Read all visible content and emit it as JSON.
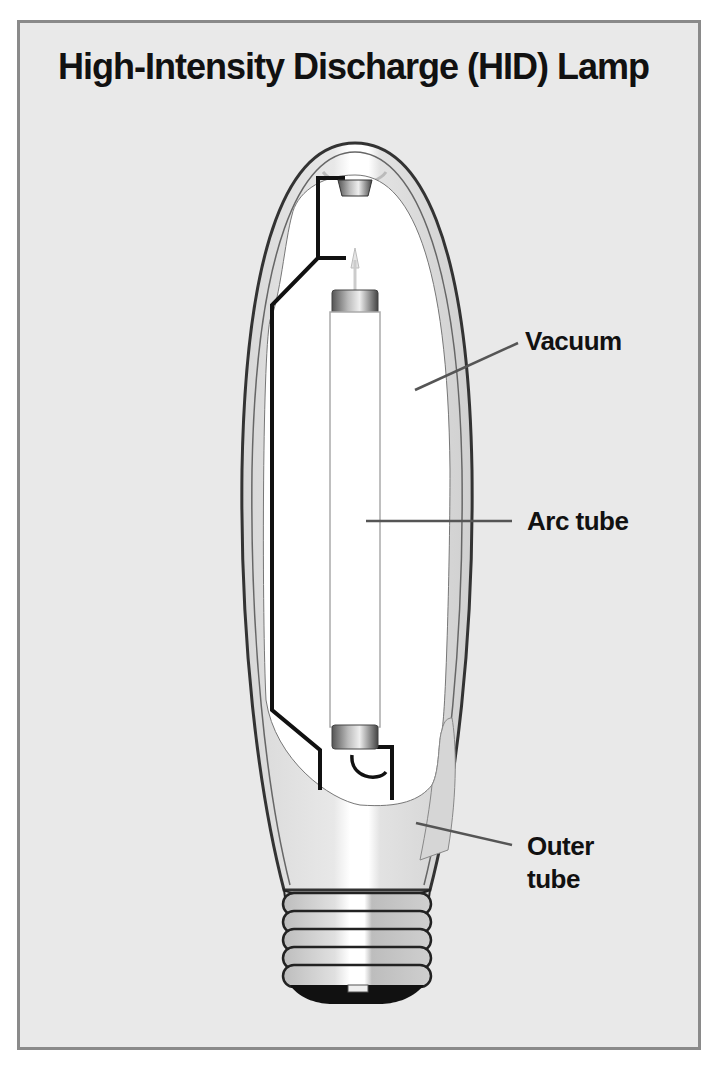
{
  "title": "High-Intensity Discharge (HID) Lamp",
  "labels": {
    "vacuum": "Vacuum",
    "arc_tube": "Arc tube",
    "outer_tube_line1": "Outer",
    "outer_tube_line2": "tube"
  },
  "colors": {
    "panel_background": "#e9e9e9",
    "panel_border": "#8a8a8a",
    "outline": "#333333",
    "wire": "#111111",
    "glass_interior": "#ffffff",
    "glass_shade": "#d4d4d4",
    "text": "#111111"
  }
}
